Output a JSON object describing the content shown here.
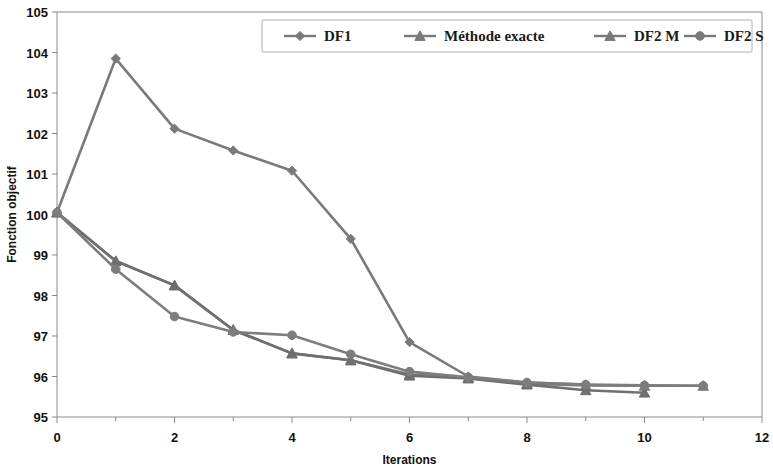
{
  "chart_data": {
    "type": "line",
    "title": "",
    "xlabel": "Iterations",
    "ylabel": "Fonction objectif",
    "xlim": [
      0,
      12
    ],
    "ylim": [
      95,
      105
    ],
    "xticks": [
      0,
      2,
      4,
      6,
      8,
      10,
      12
    ],
    "xtick_labels": [
      "0",
      "2",
      "4",
      "6",
      "8",
      "10",
      "12"
    ],
    "xminor_step": 1,
    "yticks": [
      95,
      96,
      97,
      98,
      99,
      100,
      101,
      102,
      103,
      104,
      105
    ],
    "ytick_labels": [
      "95",
      "96",
      "97",
      "98",
      "99",
      "100",
      "101",
      "102",
      "103",
      "104",
      "105"
    ],
    "grid": false,
    "legend_position": "top-center",
    "series": [
      {
        "name": "DF1",
        "marker": "diamond",
        "color": "#7a7a7a",
        "x": [
          0,
          1,
          2,
          3,
          4,
          5,
          6,
          7,
          8,
          9
        ],
        "values": [
          100.05,
          103.85,
          102.12,
          101.58,
          101.08,
          99.4,
          96.85,
          96.0,
          95.85,
          95.8
        ]
      },
      {
        "name": "Méthode exacte",
        "marker": "triangle",
        "color": "#7a7a7a",
        "x": [
          0,
          1,
          2,
          3,
          4,
          5,
          6,
          7,
          8,
          9,
          10,
          11
        ],
        "values": [
          100.05,
          98.85,
          98.25,
          97.15,
          96.57,
          96.4,
          96.05,
          95.97,
          95.82,
          95.78,
          95.77,
          95.77
        ]
      },
      {
        "name": "DF2 M",
        "marker": "triangle",
        "color": "#6f6f6f",
        "x": [
          0,
          1,
          2,
          3,
          4,
          5,
          6,
          7,
          8,
          9,
          10
        ],
        "values": [
          100.05,
          98.85,
          98.25,
          97.15,
          96.57,
          96.4,
          96.02,
          95.95,
          95.8,
          95.66,
          95.6
        ]
      },
      {
        "name": "DF2 S",
        "marker": "circle",
        "color": "#7d7d7d",
        "x": [
          0,
          1,
          2,
          3,
          4,
          5,
          6,
          7,
          8,
          9,
          10,
          11
        ],
        "values": [
          100.05,
          98.65,
          97.48,
          97.1,
          97.02,
          96.55,
          96.12,
          95.98,
          95.85,
          95.8,
          95.78,
          95.77
        ]
      }
    ]
  },
  "legend": {
    "items": [
      {
        "label": "DF1",
        "marker": "diamond"
      },
      {
        "label": "Méthode exacte",
        "marker": "triangle"
      },
      {
        "label": "DF2 M",
        "marker": "triangle"
      },
      {
        "label": "DF2 S",
        "marker": "circle"
      }
    ]
  },
  "colors": {
    "line": "#7a7a7a",
    "axis": "#8a8a8a",
    "text": "#111111",
    "legend_border": "#b0b0b0",
    "background": "#ffffff"
  }
}
